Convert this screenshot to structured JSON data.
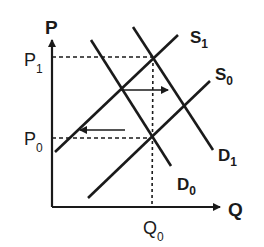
{
  "diagram": {
    "type": "supply-demand",
    "axes": {
      "y_label": "P",
      "x_label": "Q"
    },
    "price_levels": [
      {
        "label": "P",
        "sub": "1",
        "y": 57
      },
      {
        "label": "P",
        "sub": "0",
        "y": 138
      }
    ],
    "quantity_levels": [
      {
        "label": "Q",
        "sub": "0",
        "x": 152
      }
    ],
    "curves": [
      {
        "name": "S",
        "sub": "1",
        "from": [
          55,
          152
        ],
        "to": [
          178,
          35
        ]
      },
      {
        "name": "S",
        "sub": "0",
        "from": [
          88,
          198
        ],
        "to": [
          210,
          81
        ]
      },
      {
        "name": "D",
        "sub": "1",
        "from": [
          133,
          27
        ],
        "to": [
          213,
          150
        ]
      },
      {
        "name": "D",
        "sub": "0",
        "from": [
          91,
          40
        ],
        "to": [
          171,
          166
        ]
      }
    ],
    "arrows": [
      {
        "description": "demand shift right",
        "from": [
          121,
          90
        ],
        "to": [
          167,
          90
        ]
      },
      {
        "description": "supply shift left",
        "from": [
          125,
          130
        ],
        "to": [
          80,
          130
        ]
      }
    ],
    "colors": {
      "line": "#1a1a1a",
      "background": "#ffffff"
    }
  }
}
